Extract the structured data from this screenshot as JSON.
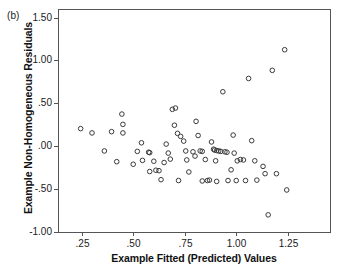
{
  "figure": {
    "panel_label": "(b)",
    "background_color": "#ffffff",
    "frame_color": "#555555",
    "marker_color": "#3a3a3a"
  },
  "chart_data": {
    "type": "scatter",
    "title": "",
    "subtitle": "",
    "panel": "(b)",
    "xlabel": "Example Fitted (Predicted) Values",
    "ylabel": "Example Non-Homogeneous Residuals",
    "xlim": [
      0.135,
      1.455
    ],
    "ylim": [
      -1.0,
      1.6
    ],
    "xticks": [
      0.25,
      0.5,
      0.75,
      1.0,
      1.25
    ],
    "xtick_labels": [
      ".25",
      ".50",
      ".75",
      "1.00",
      "1.25"
    ],
    "yticks": [
      -1.0,
      -0.5,
      0.0,
      0.5,
      1.0,
      1.5
    ],
    "ytick_labels": [
      "-1.00",
      "-.50",
      ".00",
      ".50",
      "1.00",
      "1.50"
    ],
    "grid": false,
    "legend": null,
    "marker": "open-circle",
    "points": [
      {
        "x": 0.245,
        "y": 0.205
      },
      {
        "x": 0.3,
        "y": 0.155
      },
      {
        "x": 0.395,
        "y": 0.17
      },
      {
        "x": 0.445,
        "y": 0.375
      },
      {
        "x": 0.45,
        "y": 0.255
      },
      {
        "x": 0.45,
        "y": 0.155
      },
      {
        "x": 0.36,
        "y": -0.055
      },
      {
        "x": 0.5,
        "y": -0.21
      },
      {
        "x": 0.54,
        "y": 0.04
      },
      {
        "x": 0.52,
        "y": -0.06
      },
      {
        "x": 0.575,
        "y": -0.07
      },
      {
        "x": 0.58,
        "y": -0.075
      },
      {
        "x": 0.6,
        "y": -0.175
      },
      {
        "x": 0.61,
        "y": -0.28
      },
      {
        "x": 0.625,
        "y": -0.285
      },
      {
        "x": 0.635,
        "y": -0.39
      },
      {
        "x": 0.65,
        "y": -0.19
      },
      {
        "x": 0.66,
        "y": 0.025
      },
      {
        "x": 0.67,
        "y": -0.08
      },
      {
        "x": 0.68,
        "y": -0.15
      },
      {
        "x": 0.69,
        "y": 0.43
      },
      {
        "x": 0.705,
        "y": 0.445
      },
      {
        "x": 0.7,
        "y": 0.245
      },
      {
        "x": 0.715,
        "y": 0.15
      },
      {
        "x": 0.73,
        "y": 0.115
      },
      {
        "x": 0.745,
        "y": 0.06
      },
      {
        "x": 0.755,
        "y": -0.055
      },
      {
        "x": 0.76,
        "y": -0.16
      },
      {
        "x": 0.77,
        "y": -0.3
      },
      {
        "x": 0.79,
        "y": -0.065
      },
      {
        "x": 0.8,
        "y": -0.115
      },
      {
        "x": 0.805,
        "y": 0.29
      },
      {
        "x": 0.815,
        "y": 0.125
      },
      {
        "x": 0.825,
        "y": -0.055
      },
      {
        "x": 0.835,
        "y": -0.06
      },
      {
        "x": 0.85,
        "y": -0.155
      },
      {
        "x": 0.86,
        "y": -0.4
      },
      {
        "x": 0.87,
        "y": -0.395
      },
      {
        "x": 0.88,
        "y": 0.05
      },
      {
        "x": 0.89,
        "y": -0.035
      },
      {
        "x": 0.895,
        "y": -0.045
      },
      {
        "x": 0.905,
        "y": -0.05
      },
      {
        "x": 0.9,
        "y": -0.17
      },
      {
        "x": 0.915,
        "y": -0.055
      },
      {
        "x": 0.925,
        "y": -0.06
      },
      {
        "x": 0.935,
        "y": 0.635
      },
      {
        "x": 0.945,
        "y": -0.065
      },
      {
        "x": 0.955,
        "y": -0.07
      },
      {
        "x": 0.96,
        "y": -0.4
      },
      {
        "x": 0.975,
        "y": -0.275
      },
      {
        "x": 0.985,
        "y": 0.13
      },
      {
        "x": 0.99,
        "y": -0.08
      },
      {
        "x": 1.0,
        "y": -0.4
      },
      {
        "x": 1.02,
        "y": -0.155
      },
      {
        "x": 1.035,
        "y": -0.16
      },
      {
        "x": 1.045,
        "y": -0.4
      },
      {
        "x": 1.06,
        "y": 0.79
      },
      {
        "x": 1.075,
        "y": 0.065
      },
      {
        "x": 1.09,
        "y": -0.17
      },
      {
        "x": 1.1,
        "y": -0.395
      },
      {
        "x": 1.13,
        "y": -0.235
      },
      {
        "x": 1.14,
        "y": -0.32
      },
      {
        "x": 1.155,
        "y": -0.8
      },
      {
        "x": 1.175,
        "y": 0.885
      },
      {
        "x": 1.195,
        "y": -0.32
      },
      {
        "x": 1.235,
        "y": 1.125
      },
      {
        "x": 1.245,
        "y": -0.51
      },
      {
        "x": 0.42,
        "y": -0.18
      },
      {
        "x": 0.545,
        "y": -0.165
      },
      {
        "x": 0.58,
        "y": -0.295
      },
      {
        "x": 0.72,
        "y": -0.4
      },
      {
        "x": 0.835,
        "y": -0.405
      },
      {
        "x": 0.905,
        "y": -0.41
      },
      {
        "x": 1.005,
        "y": -0.17
      }
    ]
  }
}
